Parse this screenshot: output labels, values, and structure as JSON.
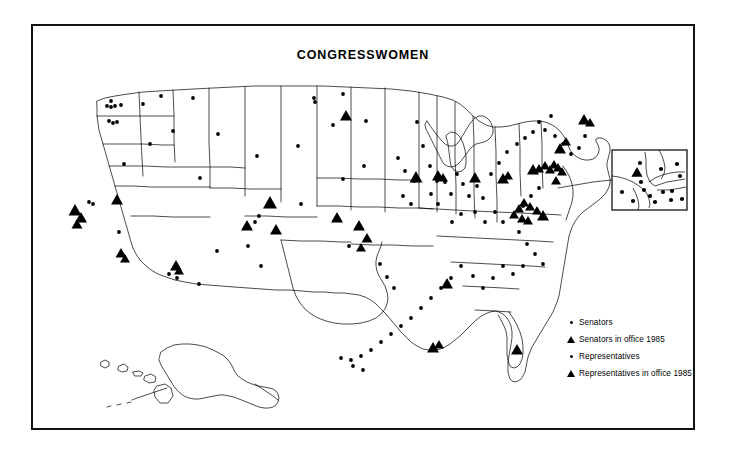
{
  "figure": {
    "title": "CONGRESSWOMEN",
    "background_color": "#ffffff",
    "border_color": "#121212",
    "ink_color": "#000000"
  },
  "legend": {
    "items": [
      {
        "marker": "dot-icon",
        "label": "Senators"
      },
      {
        "marker": "triangle-icon",
        "label": "Senators in office 1985"
      },
      {
        "marker": "dot-icon",
        "label": "Representatives"
      },
      {
        "marker": "triangle-icon",
        "label": "Representatives in office 1985"
      }
    ]
  },
  "inset": {
    "name": "new-york-metro-inset",
    "box": {
      "x": 610,
      "y": 148,
      "w": 75,
      "h": 60
    },
    "leader": [
      [
        556,
        186
      ],
      [
        610,
        178
      ]
    ]
  },
  "map": {
    "projection_note": "contiguous United States with Alaska and Hawaii",
    "outlines": [
      {
        "name": "west-coast",
        "d": "M95 92 L97 88 L101 90 L104 87 L108 89 L112 86 L116 88 L120 86 L124 88 L127 90 L131 88 L136 90 L140 88 L145 90 L150 88 L155 90 L160 89 L165 91 L168 90"
      },
      {
        "name": "national-outline",
        "d": "M95 92 L92 99 L89 108 L86 118 L83 127 L80 134 L76 141 L72 148 L69 156 L67 165 L66 174 L68 182 L71 190 L74 198 L76 206 L78 214 L81 221 L85 228 L89 235 L93 242 L97 249 L101 256 L106 262 L111 268 L116 273 L121 277 L126 280 L131 282 L136 283 L142 284 L149 285 L157 286 L166 287 L176 288 L187 289 L199 290 L212 291 L226 292 L240 293 L255 294 L270 295 L284 296 L297 297 L309 298 L320 299 L330 300 L339 302 L347 305 L354 309 L360 314 L365 320 L369 326 L373 332 L377 338 L381 344 L386 349 L392 353 L399 356 L407 358 L415 358 L423 357 L430 355 L437 352 L443 348 L448 344 L452 339 L456 334 L460 329 L464 324 L468 320 L473 316 L478 313 L483 311 L488 310 L493 310 L498 311 L503 313 L507 316 L510 320 L512 325 L513 331 L513 338 L513 346 L514 354 L516 362 L519 369 L523 375 L527 379 L531 381 L534 381 L536 378 L537 373 L537 366 L536 358 L535 350 L534 342 L534 334 L535 326 L537 319 L540 312 L543 306 L546 300 L549 294 L551 288 L553 282 L554 276 L555 270 L556 263 L557 256 L558 249 L559 242 L560 235 L561 229 L562 223 L563 218 L564 213 L566 208 L568 204 L571 200 L575 197 L579 195 L583 194 L587 193 L590 191 L592 188 L593 184 L593 180 L592 176 L591 172 L590 168 L590 164 L591 160 L593 156 L595 152 L597 149 L598 146 L598 143 L597 140 L595 137 L593 134 L591 131 L589 128 L587 126 L584 124 L581 123 L578 123 L575 124 L572 125 L569 126 L566 127 L563 128 L560 128 L557 128 L554 127 L551 126 L548 125 L544 124 L540 124 L536 124 L532 125 L527 126 L522 127 L516 128 L510 129 L503 130 L496 130 L489 130 L482 130 L475 130 L468 130 L461 130 L454 130 L447 130 L441 130 L435 130 L429 130 L423 130 L417 130 L411 130 L405 130 L399 130 L393 129 L388 128 L383 127 L378 127 L373 127 L368 128 L363 129 L359 130 L356 131 L354 132 L352 132 L350 131 L348 129 L346 127 L344 125 L342 123 L340 122 L338 121 L336 121 L334 121 L332 121 L330 120 L328 119 L326 117 L324 115 L322 113 L319 112 L316 111 L312 111 L308 111 L303 111 L298 110 L292 110 L286 109 L280 109 L274 108 L268 108 L262 108 L256 107 L250 107 L244 106 L238 106 L232 105 L226 105 L220 104 L214 104 L208 103 L202 103 L196 102 L190 102 L184 101 L178 101 L172 100 L166 100 L160 99 L154 99 L148 98 L142 98 L136 97 L130 97 L124 96 L118 96 L112 95 L106 94 L100 93 Z"
      },
      {
        "name": "state-lines-vertical-a",
        "d": "M168 90 L169 110 L170 130 L170 150 L170 170 L170 185"
      },
      {
        "name": "state-lines-vertical-b",
        "d": "M227 105 L228 130 L228 155 L228 175 L228 185"
      },
      {
        "name": "state-lines-vertical-c",
        "d": "M276 108 L277 130 L277 155 L277 180 L277 203"
      },
      {
        "name": "state-lines-vertical-d",
        "d": "M322 113 L322 140 L323 165 L323 190 L323 210"
      },
      {
        "name": "state-lines-horizontal-a",
        "d": "M95 145 L125 146 L155 147 L170 148"
      },
      {
        "name": "state-lines-horizontal-b",
        "d": "M66 185 L100 186 L135 186 L170 186 L205 187 L228 187"
      },
      {
        "name": "state-lines-horizontal-c",
        "d": "M170 210 L200 211 L228 211"
      },
      {
        "name": "state-lines-horizontal-d",
        "d": "M228 238 L260 239 L290 240 L323 240"
      },
      {
        "name": "state-lines-horizontal-e",
        "d": "M228 187 L260 187 L290 188 L323 188 L355 188 L385 189"
      },
      {
        "name": "state-lines-horizontal-f",
        "d": "M323 240 L355 241 L385 242 L415 243 L445 244 L475 245 L505 246 L530 247"
      },
      {
        "name": "state-lines-horizontal-g",
        "d": "M385 270 L415 271 L445 272 L475 273 L500 274"
      },
      {
        "name": "state-lines-horizontal-h",
        "d": "M385 296 L415 297 L445 298 L470 299"
      },
      {
        "name": "state-lines-horizontal-i",
        "d": "M385 322 L410 323 L435 323"
      },
      {
        "name": "great-lakes",
        "d": "M400 130 L405 138 L410 145 L415 150 L420 152 L425 152 L430 150 L434 146 L437 141 L440 136 L443 132"
      }
    ],
    "markers": {
      "dots": [
        [
          100,
          98
        ],
        [
          96,
          104
        ],
        [
          99,
          105
        ],
        [
          103,
          104
        ],
        [
          112,
          102
        ],
        [
          97,
          119
        ],
        [
          100,
          120
        ],
        [
          103,
          120
        ],
        [
          133,
          101
        ],
        [
          186,
          100
        ],
        [
          166,
          128
        ],
        [
          182,
          140
        ],
        [
          215,
          138
        ],
        [
          159,
          165
        ],
        [
          164,
          167
        ],
        [
          172,
          164
        ],
        [
          117,
          218
        ],
        [
          121,
          219
        ],
        [
          126,
          218
        ],
        [
          113,
          265
        ],
        [
          119,
          267
        ],
        [
          161,
          230
        ],
        [
          178,
          283
        ],
        [
          192,
          288
        ],
        [
          253,
          216
        ],
        [
          258,
          273
        ],
        [
          247,
          138
        ],
        [
          247,
          141
        ],
        [
          311,
          136
        ],
        [
          325,
          170
        ],
        [
          338,
          135
        ],
        [
          353,
          122
        ],
        [
          342,
          150
        ],
        [
          313,
          200
        ],
        [
          318,
          206
        ],
        [
          326,
          193
        ],
        [
          353,
          230
        ],
        [
          358,
          246
        ],
        [
          364,
          237
        ],
        [
          360,
          272
        ],
        [
          368,
          276
        ],
        [
          374,
          282
        ],
        [
          380,
          289
        ],
        [
          385,
          296
        ],
        [
          389,
          302
        ],
        [
          395,
          309
        ],
        [
          403,
          316
        ],
        [
          409,
          324
        ],
        [
          415,
          330
        ],
        [
          427,
          356
        ],
        [
          434,
          358
        ],
        [
          441,
          356
        ],
        [
          398,
          177
        ],
        [
          404,
          183
        ],
        [
          410,
          190
        ],
        [
          398,
          205
        ],
        [
          404,
          212
        ],
        [
          410,
          218
        ],
        [
          416,
          186
        ],
        [
          422,
          193
        ],
        [
          428,
          200
        ],
        [
          434,
          207
        ],
        [
          440,
          214
        ],
        [
          446,
          221
        ],
        [
          432,
          186
        ],
        [
          438,
          193
        ],
        [
          444,
          200
        ],
        [
          450,
          190
        ],
        [
          456,
          197
        ],
        [
          462,
          204
        ],
        [
          468,
          211
        ],
        [
          451,
          225
        ],
        [
          457,
          232
        ],
        [
          463,
          239
        ],
        [
          469,
          246
        ],
        [
          475,
          253
        ],
        [
          459,
          262
        ],
        [
          465,
          269
        ],
        [
          471,
          276
        ],
        [
          477,
          283
        ],
        [
          483,
          290
        ],
        [
          489,
          297
        ],
        [
          495,
          270
        ],
        [
          501,
          277
        ],
        [
          507,
          284
        ],
        [
          495,
          284
        ],
        [
          501,
          291
        ],
        [
          470,
          178
        ],
        [
          476,
          185
        ],
        [
          482,
          192
        ],
        [
          488,
          178
        ],
        [
          494,
          185
        ],
        [
          500,
          192
        ],
        [
          506,
          185
        ],
        [
          512,
          192
        ],
        [
          518,
          178
        ],
        [
          524,
          172
        ],
        [
          530,
          166
        ],
        [
          516,
          160
        ],
        [
          522,
          154
        ],
        [
          528,
          160
        ],
        [
          534,
          166
        ],
        [
          540,
          160
        ],
        [
          546,
          166
        ],
        [
          552,
          160
        ],
        [
          546,
          152
        ],
        [
          540,
          146
        ],
        [
          534,
          140
        ],
        [
          528,
          134
        ],
        [
          552,
          144
        ],
        [
          558,
          138
        ],
        [
          564,
          132
        ],
        [
          570,
          126
        ],
        [
          576,
          130
        ],
        [
          582,
          124
        ],
        [
          578,
          140
        ],
        [
          572,
          146
        ],
        [
          566,
          152
        ],
        [
          560,
          158
        ],
        [
          554,
          164
        ],
        [
          548,
          170
        ],
        [
          542,
          176
        ],
        [
          536,
          182
        ],
        [
          530,
          188
        ],
        [
          524,
          194
        ],
        [
          518,
          200
        ],
        [
          512,
          206
        ],
        [
          506,
          212
        ],
        [
          500,
          218
        ],
        [
          494,
          224
        ],
        [
          488,
          230
        ],
        [
          514,
          222
        ],
        [
          520,
          228
        ],
        [
          526,
          234
        ],
        [
          532,
          240
        ],
        [
          538,
          246
        ],
        [
          544,
          252
        ],
        [
          550,
          258
        ],
        [
          556,
          264
        ],
        [
          562,
          270
        ],
        [
          546,
          276
        ],
        [
          540,
          282
        ],
        [
          534,
          288
        ],
        [
          528,
          294
        ],
        [
          522,
          300
        ],
        [
          516,
          306
        ],
        [
          510,
          312
        ],
        [
          504,
          318
        ],
        [
          498,
          324
        ],
        [
          492,
          330
        ],
        [
          486,
          336
        ],
        [
          480,
          342
        ],
        [
          474,
          348
        ],
        [
          468,
          354
        ],
        [
          462,
          360
        ],
        [
          456,
          366
        ],
        [
          450,
          372
        ],
        [
          444,
          378
        ],
        [
          438,
          384
        ]
      ],
      "triangles": [
        [
          71,
          208
        ],
        [
          76,
          206
        ],
        [
          81,
          212
        ],
        [
          78,
          217
        ],
        [
          73,
          221
        ],
        [
          112,
          200
        ],
        [
          118,
          253
        ],
        [
          122,
          257
        ],
        [
          116,
          258
        ],
        [
          171,
          264
        ],
        [
          170,
          268
        ],
        [
          176,
          266
        ],
        [
          180,
          267
        ],
        [
          288,
          199
        ],
        [
          261,
          220
        ],
        [
          354,
          231
        ],
        [
          362,
          243
        ],
        [
          356,
          252
        ],
        [
          343,
          122
        ],
        [
          413,
          184
        ],
        [
          434,
          183
        ],
        [
          438,
          186
        ],
        [
          471,
          185
        ],
        [
          499,
          186
        ],
        [
          503,
          184
        ],
        [
          528,
          177
        ],
        [
          534,
          177
        ],
        [
          540,
          174
        ],
        [
          544,
          178
        ],
        [
          548,
          173
        ],
        [
          552,
          176
        ],
        [
          556,
          180
        ],
        [
          546,
          186
        ],
        [
          540,
          190
        ],
        [
          535,
          195
        ],
        [
          530,
          200
        ],
        [
          525,
          206
        ],
        [
          520,
          212
        ],
        [
          515,
          218
        ],
        [
          510,
          224
        ],
        [
          505,
          230
        ],
        [
          551,
          156
        ],
        [
          557,
          150
        ],
        [
          563,
          144
        ],
        [
          578,
          126
        ],
        [
          584,
          130
        ],
        [
          540,
          223
        ],
        [
          534,
          219
        ],
        [
          528,
          215
        ],
        [
          522,
          211
        ],
        [
          516,
          217
        ],
        [
          510,
          223
        ],
        [
          504,
          229
        ],
        [
          519,
          226
        ],
        [
          513,
          232
        ],
        [
          526,
          221
        ],
        [
          432,
          354
        ],
        [
          438,
          352
        ],
        [
          516,
          356
        ],
        [
          520,
          352
        ],
        [
          446,
          290
        ]
      ]
    }
  }
}
